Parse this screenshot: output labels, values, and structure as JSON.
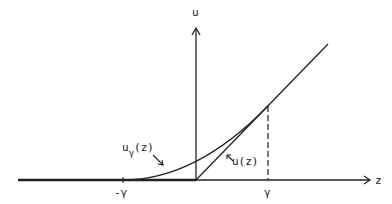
{
  "diagram": {
    "axes": {
      "x_label": "z",
      "y_label": "u"
    },
    "ticks": {
      "neg_gamma": "-γ",
      "pos_gamma": "γ"
    },
    "curves": {
      "smoothed": {
        "label_main": "u",
        "label_sub": "γ",
        "label_arg": "(z)"
      },
      "original": {
        "label": "u(z)"
      }
    },
    "colors": {
      "ink": "#222222",
      "background": "#ffffff"
    }
  }
}
